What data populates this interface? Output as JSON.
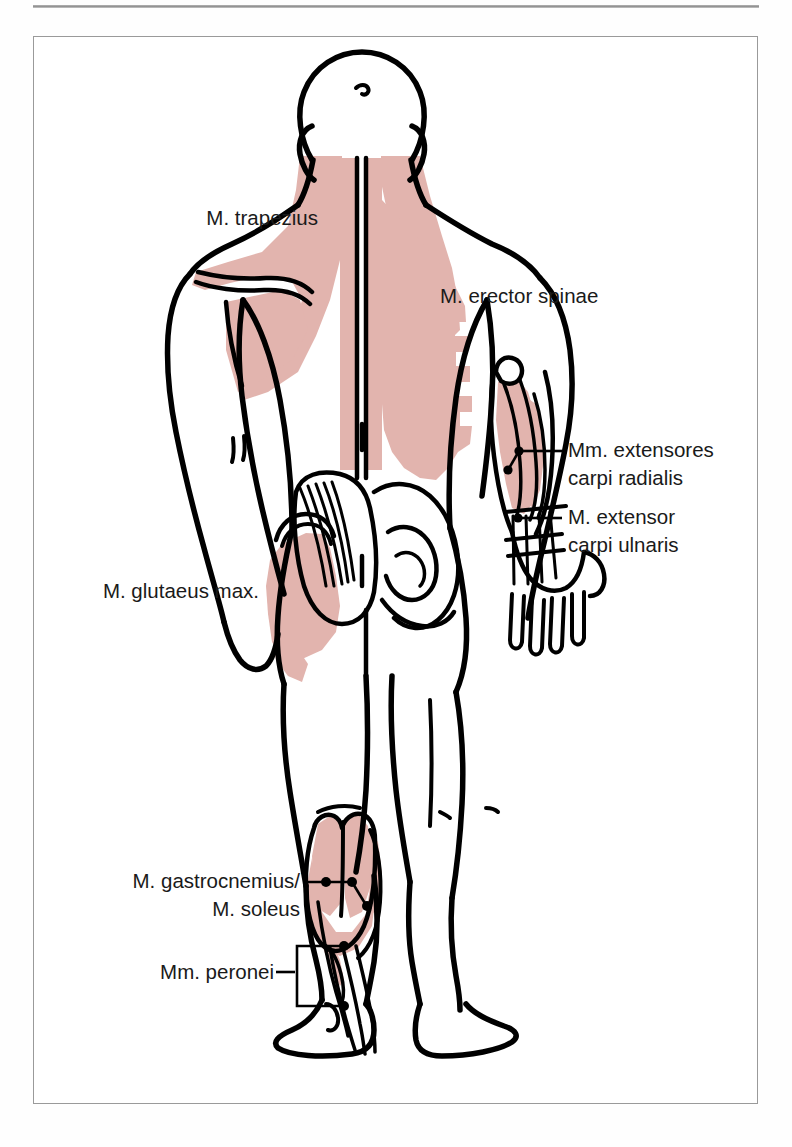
{
  "plate": {
    "title": "Posterior view of human body musculature",
    "view": "back",
    "frame_border_color": "#9a9a9a",
    "top_rule_color": "#8e8e8e",
    "muscle_fill_color": "#e2b4ae",
    "outline_color": "#000000",
    "background_color": "#ffffff",
    "label_text_color": "#1a1a1a"
  },
  "labels": [
    {
      "id": "trapezius",
      "line1": "M. trapezius",
      "line2": "",
      "anchor": "end",
      "x": 318,
      "y": 225,
      "leader": "none"
    },
    {
      "id": "erector-spinae",
      "line1": "M. erector spinae",
      "line2": "",
      "anchor": "start",
      "x": 440,
      "y": 303,
      "leader": "none"
    },
    {
      "id": "extensores-carpi-radialis",
      "line1": "Mm. extensores",
      "line2": "carpi radialis",
      "anchor": "start",
      "x": 568,
      "y": 457,
      "leader": "line"
    },
    {
      "id": "extensor-carpi-ulnaris",
      "line1": "M. extensor",
      "line2": "carpi ulnaris",
      "anchor": "start",
      "x": 568,
      "y": 524,
      "leader": "line"
    },
    {
      "id": "glutaeus-maximus",
      "line1": "M. glutaeus max.",
      "line2": "",
      "anchor": "end",
      "x": 259,
      "y": 598,
      "leader": "none"
    },
    {
      "id": "gastrocnemius-soleus",
      "line1": "M. gastrocnemius/",
      "line2": "M. soleus",
      "anchor": "end",
      "x": 300,
      "y": 888,
      "leader": "line-dots"
    },
    {
      "id": "peronei",
      "line1": "Mm. peronei",
      "line2": "",
      "anchor": "end",
      "x": 289,
      "y": 977,
      "leader": "bracket"
    }
  ],
  "muscle_regions": [
    {
      "id": "trapezius",
      "label": "M. trapezius",
      "side": "both",
      "shaded": true
    },
    {
      "id": "erector-spinae",
      "label": "M. erector spinae",
      "side": "both",
      "shaded": true
    },
    {
      "id": "extensores-carpi-radialis",
      "label": "Mm. extensores carpi radialis",
      "side": "right",
      "shaded": true
    },
    {
      "id": "extensor-carpi-ulnaris",
      "label": "M. extensor carpi ulnaris",
      "side": "right",
      "shaded": false
    },
    {
      "id": "glutaeus-maximus",
      "label": "M. glutaeus max.",
      "side": "left",
      "shaded": true
    },
    {
      "id": "gastrocnemius-soleus",
      "label": "M. gastrocnemius / M. soleus",
      "side": "left",
      "shaded": true
    },
    {
      "id": "peronei",
      "label": "Mm. peronei",
      "side": "left",
      "shaded": false
    }
  ]
}
